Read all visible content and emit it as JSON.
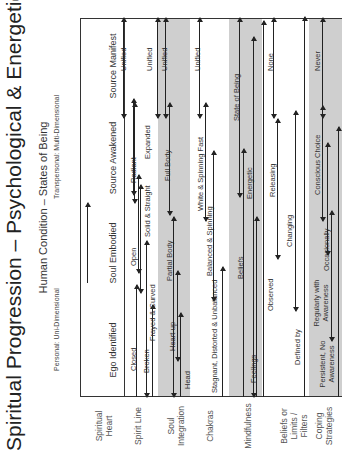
{
  "title": "Spiritual Progression – Psychological & Energetic",
  "header": {
    "subtitle": "Human Condition – States of Being",
    "dimension_left": "Personal: Uni-Dimensional",
    "dimension_right": "Transpersonal: Multi-Dimensional",
    "stages": [
      "Ego Identified",
      "Soul Embodied",
      "Source Awakened",
      "Source Manifest"
    ]
  },
  "rows": [
    {
      "label": "Spiritual Heart",
      "states": [
        "Closed",
        "Open",
        "Radiant",
        "Unified"
      ]
    },
    {
      "label": "Spirit Line",
      "states": [
        "Broken",
        "Frayed & Curved",
        "Solid & Straight",
        "Expanded",
        "Unified"
      ]
    },
    {
      "label": "Soul Integration",
      "states": [
        "Head",
        "Heart-up",
        "Partial Body",
        "Full Body",
        "Unified"
      ]
    },
    {
      "label": "Chakras",
      "states": [
        "Stagnant, Distorted & Unbalanced",
        "Balanced & Spinning",
        "White & Spinning Fast",
        "Unified"
      ]
    },
    {
      "label": "Mindfulness",
      "states": [
        "Feelings",
        "Beliefs",
        "Energetic",
        "State of Being"
      ]
    },
    {
      "label": "Beliefs or Limits / Filters",
      "states": [
        "Defined by",
        "Observed",
        "Changing",
        "Releasing",
        "None"
      ]
    },
    {
      "label": "Coping Strategies",
      "states": [
        "Persistent, No Awareness",
        "Regularly with Awareness",
        "Occasionally",
        "Conscious Choice",
        "Never"
      ]
    }
  ],
  "colors": {
    "band": "#cfcfcf",
    "line": "#222222",
    "text": "#333333"
  }
}
